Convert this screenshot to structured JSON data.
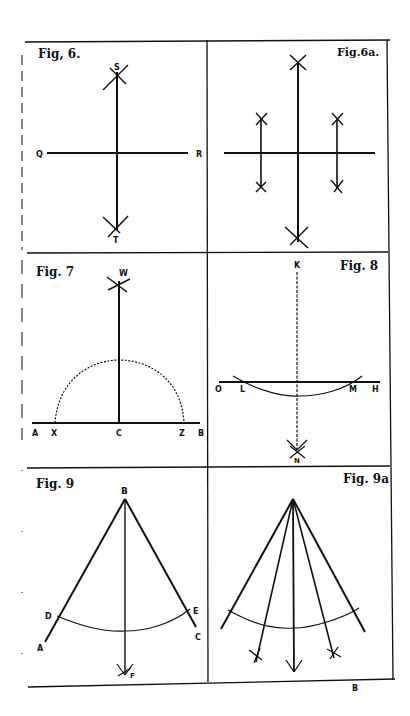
{
  "plate": {
    "footer_letter": "B",
    "figures": [
      {
        "id": "fig6",
        "title": "Fig, 6.",
        "points": [
          "S",
          "Q",
          "R",
          "T"
        ]
      },
      {
        "id": "fig6a",
        "title": "Fig.6a.",
        "points": []
      },
      {
        "id": "fig7",
        "title": "Fig. 7",
        "points": [
          "W",
          "A",
          "X",
          "C",
          "Z",
          "B"
        ]
      },
      {
        "id": "fig8",
        "title": "Fig. 8",
        "points": [
          "K",
          "O",
          "L",
          "M",
          "H",
          "N"
        ]
      },
      {
        "id": "fig9",
        "title": "Fig. 9",
        "points": [
          "B",
          "D",
          "E",
          "A",
          "C",
          "F"
        ]
      },
      {
        "id": "fig9a",
        "title": "Fig. 9a",
        "points": []
      }
    ]
  },
  "colors": {
    "ink": "#111111",
    "paper": "#ffffff"
  }
}
